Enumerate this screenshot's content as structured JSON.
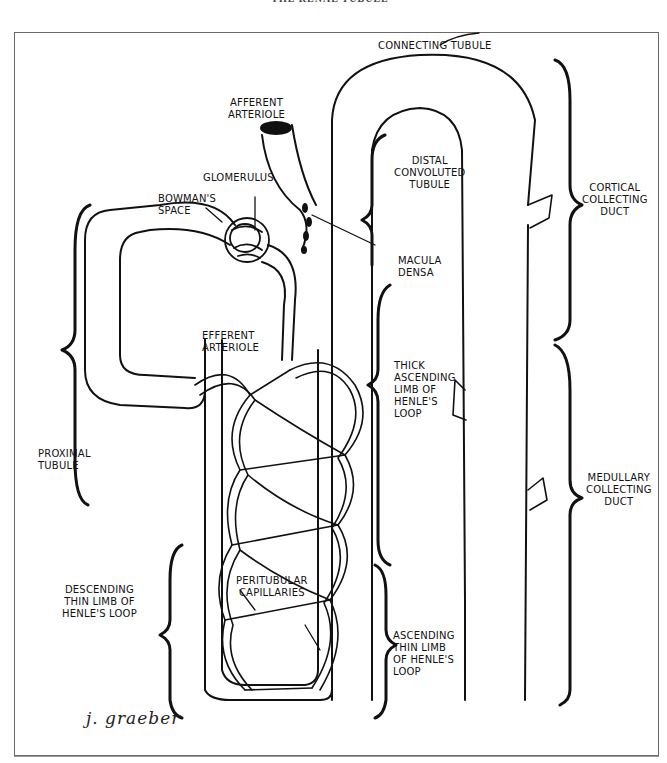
{
  "page": {
    "header_partial": "THE RENAL TUBULE",
    "signature": "j. graeber"
  },
  "diagram": {
    "labels": {
      "connecting_tubule": "CONNECTING TUBULE",
      "afferent_arteriole": "AFFERENT\nARTERIOLE",
      "glomerulus": "GLOMERULUS",
      "bowmans_space": "BOWMAN'S\nSPACE",
      "distal_convoluted_tubule": "DISTAL\nCONVOLUTED\nTUBULE",
      "cortical_collecting_duct": "CORTICAL\nCOLLECTING\nDUCT",
      "macula_densa": "MACULA\nDENSA",
      "efferent_arteriole": "EFFERENT\nARTERIOLE",
      "thick_ascending_limb": "THICK\nASCENDING\nLIMB OF\nHENLE'S\nLOOP",
      "proximal_tubule": "PROXIMAL\nTUBULE",
      "medullary_collecting_duct": "MEDULLARY\nCOLLECTING\nDUCT",
      "descending_thin_limb": "DESCENDING\nTHIN LIMB OF\nHENLE'S LOOP",
      "peritubular_capillaries": "PERITUBULAR\nCAPILLARIES",
      "ascending_thin_limb": "ASCENDING\nTHIN LIMB\nOF HENLE'S\nLOOP"
    },
    "colors": {
      "ink": "#111111",
      "frame": "#6a6a6a",
      "background": "#ffffff"
    }
  }
}
